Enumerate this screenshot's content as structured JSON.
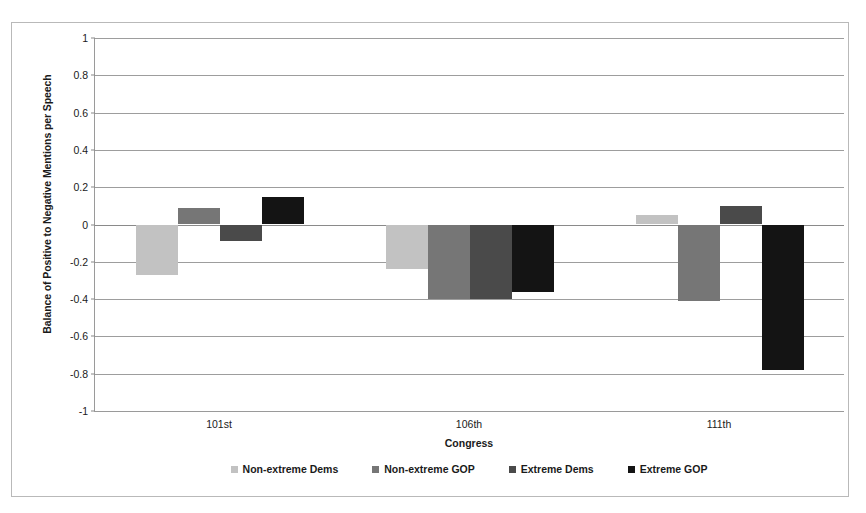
{
  "chart_data": {
    "type": "bar",
    "title": "",
    "xlabel": "Congress",
    "ylabel": "Balance of Positive to Negative Mentions per Speech",
    "categories": [
      "101st",
      "106th",
      "111th"
    ],
    "ylim": [
      -1,
      1
    ],
    "ytick_labels": [
      "1",
      "0.8",
      "0.6",
      "0.4",
      "0.2",
      "0",
      "-0.2",
      "-0.4",
      "-0.6",
      "-0.8",
      "-1"
    ],
    "ytick_values": [
      1,
      0.8,
      0.6,
      0.4,
      0.2,
      0,
      -0.2,
      -0.4,
      -0.6,
      -0.8,
      -1
    ],
    "grid": true,
    "legend_position": "bottom",
    "series": [
      {
        "name": "Non-extreme Dems",
        "color": "#c2c2c2",
        "values": [
          -0.27,
          -0.24,
          0.05
        ]
      },
      {
        "name": "Non-extreme GOP",
        "color": "#767676",
        "values": [
          0.09,
          -0.4,
          -0.41
        ]
      },
      {
        "name": "Extreme Dems",
        "color": "#4a4a4a",
        "values": [
          -0.09,
          -0.4,
          0.1
        ]
      },
      {
        "name": "Extreme GOP",
        "color": "#141414",
        "values": [
          0.15,
          -0.36,
          -0.78
        ]
      }
    ]
  }
}
